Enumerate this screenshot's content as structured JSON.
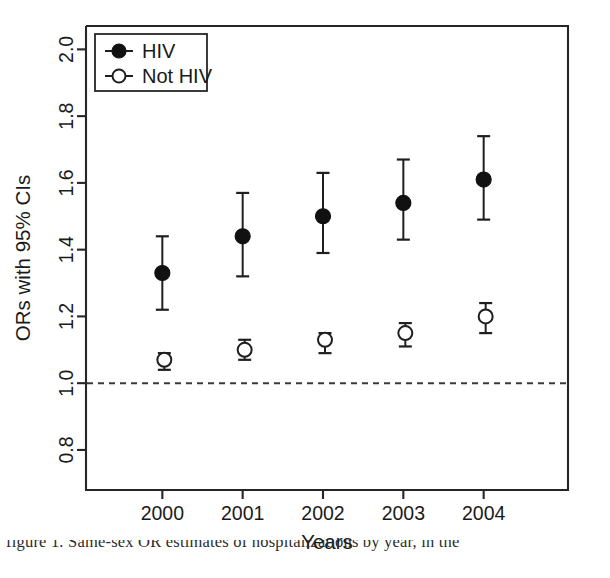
{
  "chart_data": {
    "type": "scatter",
    "title": "",
    "xlabel": "Years",
    "ylabel": "ORs with 95% CIs",
    "categories": [
      "2000",
      "2001",
      "2002",
      "2003",
      "2004"
    ],
    "x_tick_labels": [
      "2000",
      "2001",
      "2002",
      "2003",
      "2004"
    ],
    "y_tick_labels": [
      "0.8",
      "1.0",
      "1.2",
      "1.4",
      "1.6",
      "1.8",
      "2.0"
    ],
    "y_ticks": [
      0.8,
      1.0,
      1.2,
      1.4,
      1.6,
      1.8,
      2.0
    ],
    "ylim": [
      0.68,
      2.07
    ],
    "grid": false,
    "legend_position": "top-left",
    "reference_line": {
      "value": 1.0,
      "style": "dashed",
      "label": ""
    },
    "series": [
      {
        "name": "HIV",
        "marker": "filled-circle",
        "values": [
          1.33,
          1.44,
          1.5,
          1.54,
          1.61
        ],
        "ci_lower": [
          1.22,
          1.32,
          1.39,
          1.43,
          1.49
        ],
        "ci_upper": [
          1.44,
          1.57,
          1.63,
          1.67,
          1.74
        ]
      },
      {
        "name": "Not HIV",
        "marker": "open-circle",
        "values": [
          1.07,
          1.1,
          1.13,
          1.15,
          1.2
        ],
        "ci_lower": [
          1.04,
          1.07,
          1.09,
          1.11,
          1.15
        ],
        "ci_upper": [
          1.09,
          1.13,
          1.15,
          1.18,
          1.24
        ]
      }
    ],
    "colors": {
      "hiv_marker": "#111111",
      "not_hiv_marker": "#ffffff",
      "line": "#1f1f1f",
      "axis": "#262626",
      "reference_line": "#3a3a3a"
    }
  },
  "legend": {
    "entries": [
      {
        "label": "HIV",
        "marker": "filled-circle"
      },
      {
        "label": "Not HIV",
        "marker": "open-circle"
      }
    ]
  },
  "caption": {
    "partial_line": "figure 1. Same-sex OR estimates of hospitalizations by year, in the"
  }
}
